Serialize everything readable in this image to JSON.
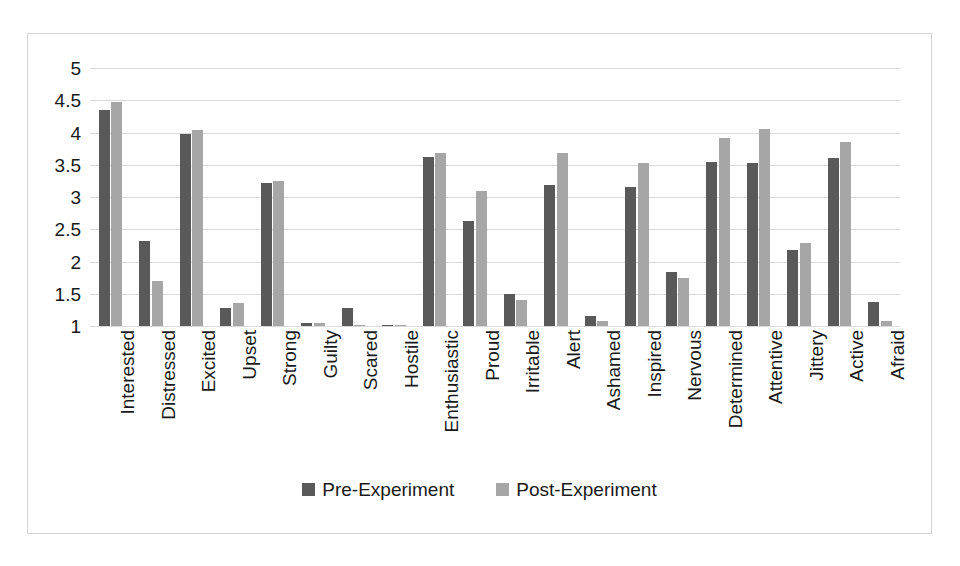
{
  "chart_data": {
    "type": "bar",
    "title": "",
    "xlabel": "",
    "ylabel": "",
    "ylim": [
      1,
      5
    ],
    "yticks": [
      1,
      1.5,
      2,
      2.5,
      3,
      3.5,
      4,
      4.5,
      5
    ],
    "ytick_labels": [
      "1",
      "1.5",
      "2",
      "2.5",
      "3",
      "3.5",
      "4",
      "4.5",
      "5"
    ],
    "grid": true,
    "legend_position": "bottom",
    "categories": [
      "Interested",
      "Distressed",
      "Excited",
      "Upset",
      "Strong",
      "Guilty",
      "Scared",
      "Hostile",
      "Enthusiastic",
      "Proud",
      "Irritable",
      "Alert",
      "Ashamed",
      "Inspired",
      "Nervous",
      "Determined",
      "Attentive",
      "Jittery",
      "Active",
      "Afraid"
    ],
    "series": [
      {
        "name": "Pre-Experiment",
        "color": "#595959",
        "values": [
          4.35,
          2.32,
          3.98,
          1.28,
          3.22,
          1.05,
          1.28,
          1.02,
          3.62,
          2.63,
          1.5,
          3.18,
          1.15,
          3.15,
          1.83,
          3.55,
          3.52,
          2.18,
          3.6,
          1.38
        ]
      },
      {
        "name": "Post-Experiment",
        "color": "#a6a6a6",
        "values": [
          4.48,
          1.7,
          4.04,
          1.35,
          3.25,
          1.05,
          1.02,
          1.02,
          3.68,
          3.1,
          1.4,
          3.68,
          1.08,
          3.52,
          1.75,
          3.92,
          4.05,
          2.28,
          3.85,
          1.08
        ]
      }
    ]
  },
  "legend": {
    "items": [
      {
        "label": "Pre-Experiment",
        "color": "#595959"
      },
      {
        "label": "Post-Experiment",
        "color": "#a6a6a6"
      }
    ]
  },
  "style": {
    "bar_pre_color": "#595959",
    "bar_post_color": "#a6a6a6",
    "gridline_color": "#d9d9d9",
    "frame_border_color": "#d4d4d4",
    "background": "#ffffff",
    "text_color": "#1a1a1a"
  }
}
